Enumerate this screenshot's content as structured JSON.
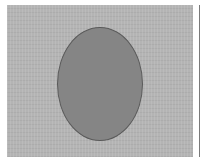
{
  "image": {
    "background": "#ffffff",
    "panel": {
      "color": "#b4b4b4",
      "x": 7,
      "y": 5,
      "width": 186,
      "height": 152
    },
    "ellipse": {
      "cx": 100,
      "cy": 84,
      "rx": 43,
      "ry": 57,
      "fill": "#858585",
      "stroke": "#5a5a5a"
    },
    "right_edge_line": {
      "x": 199,
      "color": "#7a7a7a"
    }
  }
}
